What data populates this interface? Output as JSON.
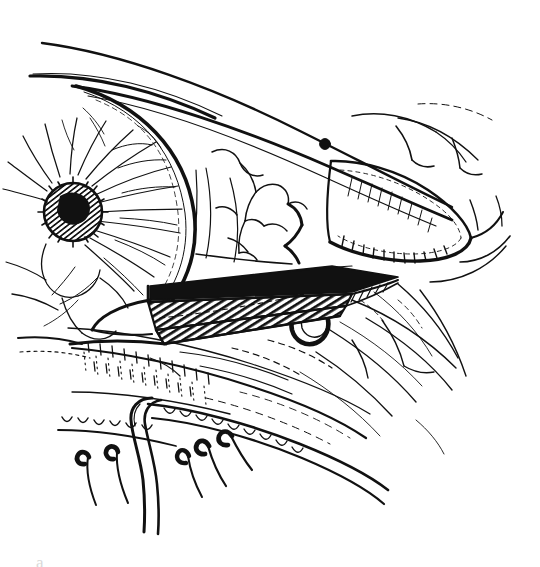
{
  "figure": {
    "medium": "pen-and-ink line drawing",
    "background_color": "#FFFFFF",
    "ink_color": "#111111",
    "width": 540,
    "height": 567,
    "caption_fragment": "a"
  },
  "structures": [
    {
      "id": "brow-sweep",
      "label": "Upper brow sweep line"
    },
    {
      "id": "upper-lid-margin",
      "label": "Upper eyelid margin"
    },
    {
      "id": "cornea-limbus",
      "label": "Cornea and limbal arc"
    },
    {
      "id": "iris-radial-fibers",
      "label": "Iris with radial stromal fibers"
    },
    {
      "id": "pupil",
      "label": "Pupil (cross-hatched)"
    },
    {
      "id": "sclera-conjunctiva",
      "label": "Sclera with overlying conjunctiva"
    },
    {
      "id": "conjunctival-vessels",
      "label": "Conjunctival vessels"
    },
    {
      "id": "punctum-dot",
      "label": "Punctum marker dot"
    },
    {
      "id": "tarsal-plate",
      "label": "Tarsal plate of lower lid"
    },
    {
      "id": "lateral-canthus",
      "label": "Lateral canthus and skin folds"
    },
    {
      "id": "lower-fornix",
      "label": "Lower conjunctival fornix, stippled"
    },
    {
      "id": "instrument-blade",
      "label": "Hatched surgical blade / retractor"
    },
    {
      "id": "instrument-hook",
      "label": "Instrument hook loop"
    },
    {
      "id": "lid-margin-scallops",
      "label": "Lower lid margin scalloping"
    },
    {
      "id": "eyelashes",
      "label": "Eyelashes"
    },
    {
      "id": "suture-strand",
      "label": "Suture strand loop"
    },
    {
      "id": "temple-skin-folds",
      "label": "Temporal skin fold lines"
    }
  ]
}
